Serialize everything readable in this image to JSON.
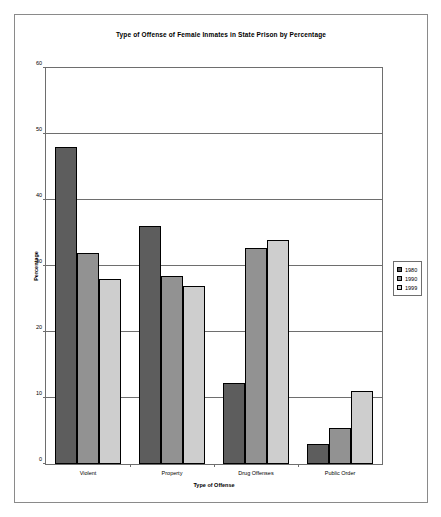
{
  "chart_data": {
    "type": "bar",
    "title": "Type of Offense of Female Inmates in State Prison by Percentage",
    "xlabel": "Type of Offense",
    "ylabel": "Percentage",
    "categories": [
      "Violent",
      "Property",
      "Drug Offenses",
      "Public Order"
    ],
    "series": [
      {
        "name": "1980",
        "color": "#5d5d5d",
        "values": [
          48,
          36,
          12.2,
          3
        ]
      },
      {
        "name": "1990",
        "color": "#929292",
        "values": [
          32,
          28.5,
          32.8,
          5.5
        ]
      },
      {
        "name": "1999",
        "color": "#cecece",
        "values": [
          28,
          27,
          34,
          11
        ]
      }
    ],
    "ylim": [
      0,
      60
    ],
    "yticks": [
      0,
      10,
      20,
      30,
      40,
      50,
      60
    ],
    "ytick_labels": [
      "0",
      "10",
      "20",
      "30",
      "40",
      "50",
      "60"
    ],
    "grid": "horizontal",
    "legend_position": "right"
  }
}
